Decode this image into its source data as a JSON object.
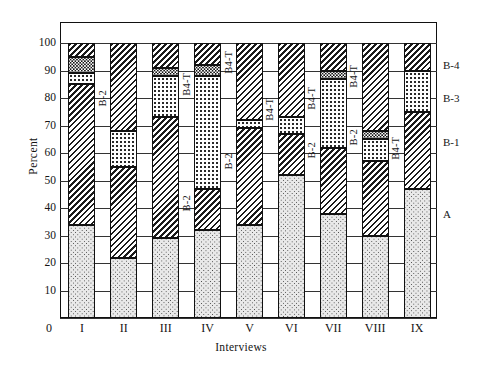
{
  "chart_data": {
    "type": "bar",
    "subtype": "stacked-bar-100-percent",
    "title": "",
    "xlabel": "Interviews",
    "ylabel": "Percent",
    "ylim": [
      0,
      100
    ],
    "yticks": [
      0,
      10,
      20,
      30,
      40,
      50,
      60,
      70,
      80,
      90,
      100
    ],
    "grid": true,
    "legend_position": "right-axis-labels",
    "categories": [
      "I",
      "II",
      "III",
      "IV",
      "V",
      "VI",
      "VII",
      "VIII",
      "IX"
    ],
    "series": [
      {
        "name": "A",
        "pattern": "light-dots",
        "values": [
          34,
          22,
          29,
          32,
          34,
          52,
          38,
          30,
          47
        ]
      },
      {
        "name": "B-1",
        "pattern": "hatch",
        "values": [
          51,
          33,
          44,
          15,
          35,
          15,
          24,
          27,
          28
        ]
      },
      {
        "name": "B-2",
        "pattern": "dots",
        "values": [
          4,
          13,
          15,
          41,
          3,
          6,
          25,
          8,
          15
        ]
      },
      {
        "name": "B-3",
        "pattern": "dark-dots",
        "values": [
          6,
          0,
          3,
          4,
          0,
          0,
          3,
          3,
          0
        ]
      },
      {
        "name": "B-4",
        "pattern": "hatch",
        "values": [
          5,
          32,
          9,
          8,
          28,
          27,
          10,
          32,
          10
        ]
      }
    ],
    "stack_boundaries": {
      "I": [
        0,
        34,
        85,
        89,
        95,
        100
      ],
      "II": [
        0,
        22,
        55,
        68,
        68,
        100
      ],
      "III": [
        0,
        29,
        73,
        88,
        91,
        100
      ],
      "IV": [
        0,
        32,
        47,
        88,
        92,
        100
      ],
      "V": [
        0,
        34,
        69,
        72,
        72,
        100
      ],
      "VI": [
        0,
        52,
        67,
        73,
        73,
        100
      ],
      "VII": [
        0,
        38,
        62,
        87,
        90,
        100
      ],
      "VIII": [
        0,
        30,
        57,
        65,
        68,
        100
      ],
      "IX": [
        0,
        47,
        75,
        90,
        90,
        100
      ]
    },
    "right_axis_labels": [
      {
        "text": "B-4",
        "value": 92
      },
      {
        "text": "B-3",
        "value": 80
      },
      {
        "text": "B-1",
        "value": 64
      },
      {
        "text": "A",
        "value": 38
      }
    ],
    "inline_annotations": [
      {
        "text": "B-2",
        "after_category": "I",
        "value": 80
      },
      {
        "text": "B4-T",
        "after_category": "III",
        "value": 85
      },
      {
        "text": "B4-T",
        "after_category": "IV",
        "value": 93
      },
      {
        "text": "B-2",
        "after_category": "III",
        "value": 42
      },
      {
        "text": "B4-T",
        "after_category": "V",
        "value": 76
      },
      {
        "text": "B-2",
        "after_category": "IV",
        "value": 57
      },
      {
        "text": "B4-T",
        "after_category": "VI",
        "value": 80
      },
      {
        "text": "B-2",
        "after_category": "VI",
        "value": 61
      },
      {
        "text": "B4-T",
        "after_category": "VII",
        "value": 88
      },
      {
        "text": "B-2",
        "after_category": "VII",
        "value": 66
      },
      {
        "text": "B4-T",
        "after_category": "VIII",
        "value": 62
      }
    ]
  }
}
